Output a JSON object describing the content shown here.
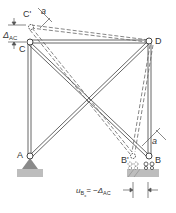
{
  "diagram": {
    "type": "truss-deflection",
    "nodes": {
      "A": {
        "label": "A"
      },
      "B": {
        "label": "B"
      },
      "B_prime": {
        "label": "B'"
      },
      "C": {
        "label": "C"
      },
      "C_prime": {
        "label": "C'"
      },
      "D": {
        "label": "D"
      }
    },
    "annotations": {
      "delta_ac": "Δ",
      "delta_ac_sub": "AC",
      "angle_top": "a",
      "angle_bottom": "a",
      "displacement_lhs_u": "u",
      "displacement_lhs_sub": "B",
      "displacement_lhs_subsub": "x",
      "displacement_rhs": "= −Δ",
      "displacement_rhs_sub": "AC"
    },
    "colors": {
      "member": "#555555",
      "support": "#8a8a8a",
      "ground": "#b8b8b8",
      "text": "#333333"
    }
  }
}
